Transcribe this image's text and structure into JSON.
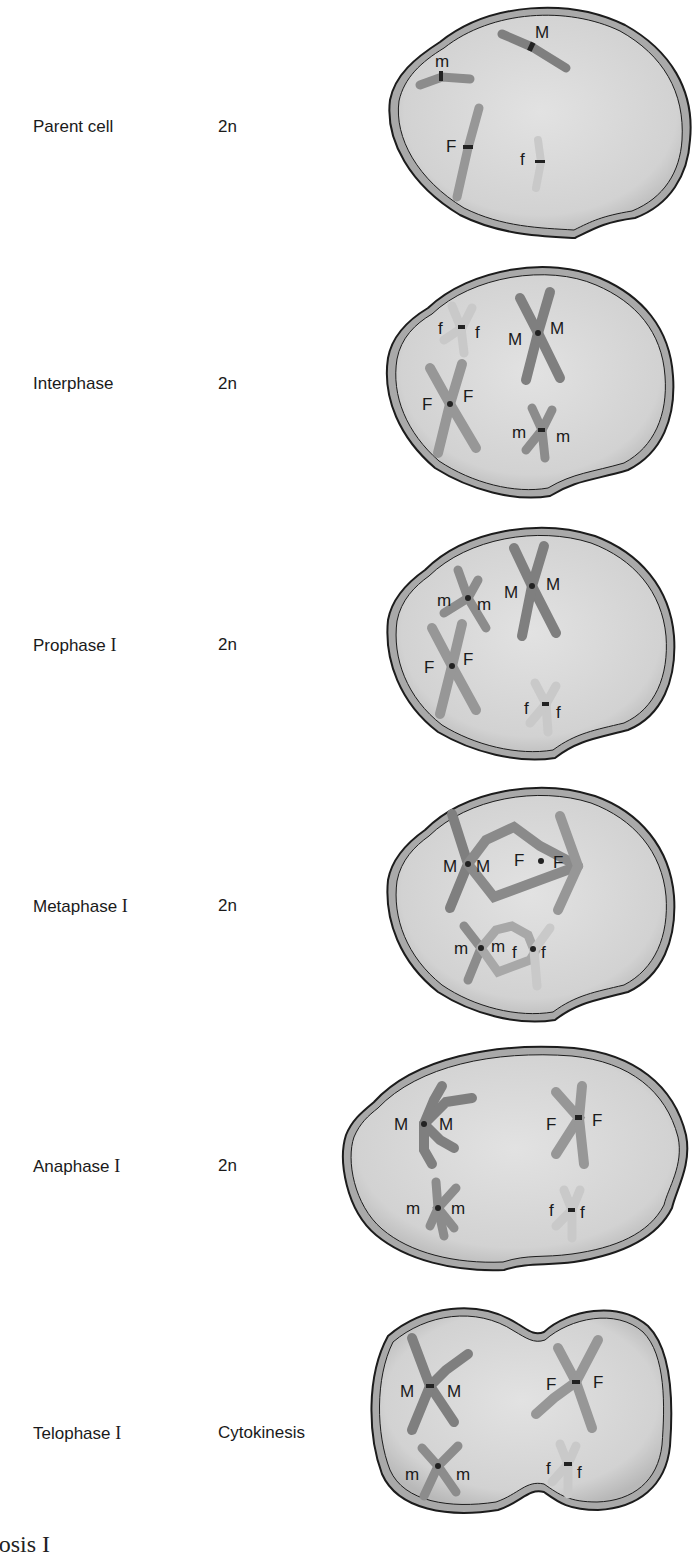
{
  "figure": {
    "title_partial": "iosis I",
    "colors": {
      "cytoplasm": "#d6d6d6",
      "membrane_fill": "#a9a9a9",
      "membrane_stroke": "#1c1c1c",
      "chromosome_M": "#7f7f7f",
      "chromosome_F": "#979797",
      "chromosome_m": "#8c8c8c",
      "chromosome_f": "#c9c9c9",
      "centromere": "#222222"
    },
    "stages": [
      {
        "name": "Parent cell",
        "ploidy": "2n",
        "chromosomes": [
          "M",
          "m",
          "F",
          "f"
        ]
      },
      {
        "name": "Interphase",
        "ploidy": "2n",
        "chromosomes": [
          "f",
          "f",
          "M",
          "M",
          "F",
          "F",
          "m",
          "m"
        ]
      },
      {
        "name_main": "Prophase",
        "name_roman": "I",
        "ploidy": "2n",
        "chromosomes": [
          "m",
          "m",
          "M",
          "M",
          "F",
          "F",
          "f",
          "f"
        ]
      },
      {
        "name_main": "Metaphase",
        "name_roman": "I",
        "ploidy": "2n",
        "chromosomes": [
          "M",
          "M",
          "F",
          "F",
          "m",
          "m",
          "f",
          "f"
        ]
      },
      {
        "name_main": "Anaphase",
        "name_roman": "I",
        "ploidy": "2n",
        "chromosomes": [
          "M",
          "M",
          "F",
          "F",
          "m",
          "m",
          "f",
          "f"
        ]
      },
      {
        "name_main": "Telophase",
        "name_roman": "I",
        "ploidy": "Cytokinesis",
        "chromosomes": [
          "M",
          "M",
          "F",
          "F",
          "m",
          "m",
          "f",
          "f"
        ]
      }
    ]
  }
}
